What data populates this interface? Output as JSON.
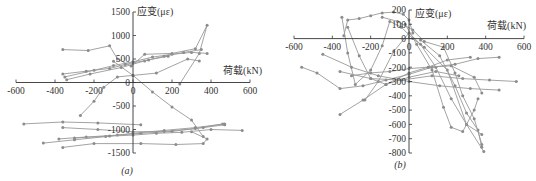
{
  "figure": {
    "panels": [
      {
        "id": "a",
        "caption": "(a)"
      },
      {
        "id": "b",
        "caption": "(b)"
      }
    ],
    "line_color": "#999999",
    "marker_color": "#8c8c8c",
    "axis_color": "#333333"
  },
  "chart_data": [
    {
      "type": "line",
      "title": "",
      "caption": "(a)",
      "xlabel": "荷载(kN)",
      "ylabel": "应变(με)",
      "xlim": [
        -600,
        600
      ],
      "ylim": [
        -1500,
        1500
      ],
      "xticks": [
        -600,
        -400,
        -200,
        0,
        200,
        400,
        600
      ],
      "xtick_labels": [
        "-600",
        "-400",
        "-200",
        "0",
        "200",
        "400",
        "600"
      ],
      "yticks": [
        1500,
        1000,
        500,
        0,
        -500,
        -1000,
        -1500
      ],
      "ytick_labels": [
        "1500",
        "1000",
        "500",
        "0",
        "-500",
        "-1000",
        "-1500"
      ],
      "grid": false,
      "legend": null,
      "series": [
        {
          "name": "gauge-1",
          "points": [
            [
              -360,
              700
            ],
            [
              -230,
              680
            ],
            [
              -120,
              780
            ],
            [
              -80,
              500
            ],
            [
              -10,
              350
            ],
            [
              60,
              600
            ],
            [
              200,
              620
            ],
            [
              320,
              720
            ],
            [
              380,
              1220
            ],
            [
              340,
              620
            ],
            [
              240,
              -30
            ]
          ]
        },
        {
          "name": "gauge-2",
          "points": [
            [
              -350,
              120
            ],
            [
              -200,
              260
            ],
            [
              -100,
              360
            ],
            [
              0,
              440
            ],
            [
              100,
              540
            ],
            [
              200,
              600
            ],
            [
              300,
              640
            ],
            [
              380,
              620
            ]
          ]
        },
        {
          "name": "gauge-3",
          "points": [
            [
              -340,
              60
            ],
            [
              -220,
              180
            ],
            [
              -60,
              320
            ],
            [
              60,
              460
            ],
            [
              160,
              560
            ],
            [
              260,
              640
            ],
            [
              350,
              700
            ]
          ]
        },
        {
          "name": "gauge-4",
          "points": [
            [
              -270,
              -700
            ],
            [
              -200,
              -400
            ],
            [
              -150,
              -100
            ],
            [
              -80,
              120
            ],
            [
              0,
              150
            ],
            [
              120,
              200
            ],
            [
              280,
              500
            ],
            [
              340,
              460
            ]
          ]
        },
        {
          "name": "gauge-5",
          "points": [
            [
              -360,
              180
            ],
            [
              -240,
              240
            ],
            [
              -120,
              300
            ],
            [
              -40,
              380
            ],
            [
              0,
              420
            ],
            [
              80,
              480
            ],
            [
              180,
              560
            ]
          ]
        },
        {
          "name": "gauge-6",
          "points": [
            [
              -100,
              450
            ],
            [
              0,
              150
            ],
            [
              100,
              -200
            ],
            [
              200,
              -520
            ],
            [
              300,
              -800
            ],
            [
              360,
              -1150
            ]
          ]
        },
        {
          "name": "gauge-7",
          "points": [
            [
              -560,
              -880
            ],
            [
              -360,
              -840
            ],
            [
              -180,
              -860
            ],
            [
              40,
              -900
            ]
          ]
        },
        {
          "name": "gauge-8",
          "points": [
            [
              -360,
              -960
            ],
            [
              -180,
              -1000
            ],
            [
              0,
              -1050
            ],
            [
              160,
              -1040
            ],
            [
              320,
              -980
            ],
            [
              460,
              -880
            ]
          ]
        },
        {
          "name": "gauge-9",
          "points": [
            [
              -380,
              -1200
            ],
            [
              -240,
              -1160
            ],
            [
              -80,
              -1120
            ],
            [
              40,
              -1080
            ],
            [
              200,
              -1040
            ],
            [
              360,
              -960
            ],
            [
              470,
              -900
            ]
          ]
        },
        {
          "name": "gauge-10",
          "points": [
            [
              -460,
              -1290
            ],
            [
              -300,
              -1220
            ],
            [
              -140,
              -1150
            ],
            [
              0,
              -1080
            ],
            [
              160,
              -1020
            ],
            [
              320,
              -960
            ],
            [
              470,
              -880
            ]
          ]
        },
        {
          "name": "gauge-11",
          "points": [
            [
              -360,
              -1380
            ],
            [
              -200,
              -1300
            ],
            [
              40,
              -1300
            ],
            [
              220,
              -1320
            ],
            [
              360,
              -1300
            ],
            [
              380,
              -1200
            ],
            [
              300,
              -1050
            ]
          ]
        },
        {
          "name": "gauge-12",
          "points": [
            [
              -300,
              -1180
            ],
            [
              -120,
              -1140
            ],
            [
              0,
              -1120
            ],
            [
              120,
              -1080
            ],
            [
              250,
              -1060
            ],
            [
              400,
              -1000
            ],
            [
              560,
              -1020
            ]
          ]
        }
      ]
    },
    {
      "type": "line",
      "title": "",
      "caption": "(b)",
      "xlabel": "荷载(kN)",
      "ylabel": "应变(με)",
      "xlim": [
        -600,
        600
      ],
      "ylim": [
        -800,
        200
      ],
      "xticks": [
        -600,
        -400,
        -200,
        0,
        200,
        400,
        600
      ],
      "xtick_labels": [
        "-600",
        "-400",
        "-200",
        "0",
        "200",
        "400",
        "600"
      ],
      "yticks": [
        200,
        100,
        0,
        -100,
        -200,
        -300,
        -400,
        -500,
        -600,
        -700,
        -800
      ],
      "ytick_labels": [
        "200",
        "100",
        "0",
        "-100",
        "-200",
        "-300",
        "-400",
        "-500",
        "-600",
        "-700",
        "-800"
      ],
      "grid": false,
      "legend": null,
      "series": [
        {
          "name": "gauge-1",
          "points": [
            [
              -340,
              20
            ],
            [
              -320,
              130
            ],
            [
              -260,
              140
            ],
            [
              -200,
              160
            ],
            [
              -140,
              180
            ],
            [
              -80,
              185
            ],
            [
              -30,
              170
            ],
            [
              0,
              130
            ],
            [
              20,
              40
            ]
          ]
        },
        {
          "name": "gauge-2",
          "points": [
            [
              -350,
              150
            ],
            [
              -320,
              -100
            ],
            [
              -280,
              -320
            ],
            [
              -200,
              -220
            ],
            [
              -140,
              -50
            ],
            [
              -100,
              120
            ],
            [
              -40,
              80
            ],
            [
              20,
              0
            ],
            [
              80,
              -60
            ],
            [
              200,
              -220
            ],
            [
              300,
              -600
            ],
            [
              390,
              -790
            ]
          ]
        },
        {
          "name": "gauge-3",
          "points": [
            [
              -560,
              -200
            ],
            [
              -480,
              -240
            ],
            [
              -360,
              -350
            ],
            [
              -240,
              -330
            ],
            [
              -120,
              -290
            ],
            [
              0,
              -250
            ],
            [
              120,
              -200
            ],
            [
              240,
              -180
            ],
            [
              360,
              -140
            ],
            [
              470,
              -130
            ]
          ]
        },
        {
          "name": "gauge-4",
          "points": [
            [
              -450,
              -110
            ],
            [
              -300,
              -200
            ],
            [
              -160,
              -260
            ],
            [
              0,
              -300
            ],
            [
              160,
              -330
            ],
            [
              320,
              -350
            ],
            [
              470,
              -360
            ]
          ]
        },
        {
          "name": "gauge-5",
          "points": [
            [
              -360,
              -530
            ],
            [
              -240,
              -430
            ],
            [
              -120,
              -320
            ],
            [
              0,
              -240
            ],
            [
              100,
              -200
            ],
            [
              200,
              -150
            ],
            [
              320,
              -130
            ]
          ]
        },
        {
          "name": "gauge-6",
          "points": [
            [
              -230,
              -430
            ],
            [
              -160,
              -300
            ],
            [
              -80,
              -90
            ],
            [
              0,
              40
            ],
            [
              60,
              -40
            ],
            [
              140,
              -200
            ],
            [
              220,
              -420
            ],
            [
              300,
              -600
            ],
            [
              380,
              -670
            ]
          ]
        },
        {
          "name": "gauge-7",
          "points": [
            [
              -20,
              100
            ],
            [
              40,
              -40
            ],
            [
              120,
              -220
            ],
            [
              180,
              -480
            ],
            [
              220,
              -620
            ],
            [
              280,
              -650
            ],
            [
              340,
              -500
            ],
            [
              360,
              -420
            ]
          ]
        },
        {
          "name": "gauge-8",
          "points": [
            [
              -300,
              -260
            ],
            [
              -200,
              -240
            ],
            [
              -100,
              -230
            ],
            [
              0,
              -210
            ],
            [
              100,
              -200
            ],
            [
              220,
              -190
            ],
            [
              340,
              -270
            ],
            [
              380,
              -380
            ]
          ]
        },
        {
          "name": "gauge-9",
          "points": [
            [
              -360,
              -230
            ],
            [
              -200,
              -280
            ],
            [
              -40,
              -290
            ],
            [
              120,
              -260
            ],
            [
              280,
              -280
            ],
            [
              420,
              -290
            ],
            [
              560,
              -300
            ]
          ]
        },
        {
          "name": "gauge-10",
          "points": [
            [
              -320,
              80
            ],
            [
              -260,
              -120
            ],
            [
              -200,
              -280
            ],
            [
              -120,
              -320
            ],
            [
              0,
              -270
            ],
            [
              140,
              -230
            ],
            [
              260,
              -260
            ]
          ]
        },
        {
          "name": "gauge-11",
          "points": [
            [
              60,
              -10
            ],
            [
              160,
              -120
            ],
            [
              240,
              -330
            ],
            [
              300,
              -520
            ],
            [
              360,
              -640
            ],
            [
              380,
              -760
            ]
          ]
        },
        {
          "name": "gauge-12",
          "points": [
            [
              -140,
              150
            ],
            [
              -60,
              120
            ],
            [
              20,
              60
            ],
            [
              80,
              -20
            ],
            [
              180,
              -60
            ],
            [
              240,
              -240
            ],
            [
              280,
              -400
            ],
            [
              340,
              -560
            ],
            [
              380,
              -740
            ]
          ]
        }
      ]
    }
  ]
}
